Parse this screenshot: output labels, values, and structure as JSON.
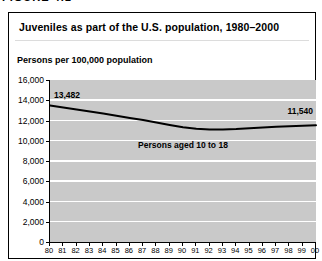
{
  "figure_label": "FIGURE 4.1",
  "panel": {
    "title": "Juveniles as part of the U.S. population, 1980–2000"
  },
  "chart_data": {
    "type": "line",
    "title": "Juveniles as part of the U.S. population, 1980–2000",
    "ylabel": "Persons per 100,000 population",
    "xlabel": "",
    "ylim": [
      0,
      16000
    ],
    "ytick_step": 2000,
    "yticks": [
      "16,000",
      "14,000",
      "12,000",
      "10,000",
      "8,000",
      "6,000",
      "4,000",
      "2,000",
      "0"
    ],
    "grid": true,
    "plot_background": "#c9c9c9",
    "gridline_color": "#ffffff",
    "line_color": "#000000",
    "categories": [
      "80",
      "81",
      "82",
      "83",
      "84",
      "85",
      "86",
      "87",
      "88",
      "89",
      "90",
      "91",
      "92",
      "93",
      "94",
      "95",
      "96",
      "97",
      "98",
      "99",
      "00"
    ],
    "series": [
      {
        "name": "Persons aged 10 to 18",
        "values": [
          13482,
          13280,
          13080,
          12880,
          12680,
          12470,
          12260,
          12040,
          11810,
          11570,
          11340,
          11190,
          11110,
          11100,
          11150,
          11230,
          11310,
          11380,
          11440,
          11490,
          11540
        ]
      }
    ],
    "annotations": {
      "start_value": "13,482",
      "end_value": "11,540",
      "series_label": "Persons aged 10 to 18"
    }
  }
}
